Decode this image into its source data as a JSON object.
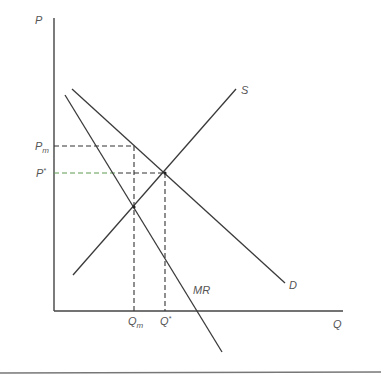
{
  "diagram": {
    "colors": {
      "axis": "#444444",
      "curve": "#3a3a3a",
      "dash": "#333333",
      "dash_green": "#5e9a52",
      "label": "#555555",
      "rule": "#777777"
    },
    "axes": {
      "y_label": "P",
      "x_label": "Q"
    },
    "curves": {
      "supply": {
        "label": "S",
        "x1": 73,
        "y1": 275,
        "x2": 236,
        "y2": 89
      },
      "demand": {
        "label": "D",
        "x1": 72,
        "y1": 89,
        "x2": 285,
        "y2": 283
      },
      "marginal_revenue": {
        "label": "MR",
        "x1": 65,
        "y1": 95,
        "x2": 222,
        "y2": 352
      }
    },
    "price_labels": {
      "monopoly": {
        "base": "P",
        "sub": "m"
      },
      "competitive": {
        "base": "P",
        "sup": "*"
      }
    },
    "quantity_labels": {
      "monopoly": {
        "base": "Q",
        "sub": "m"
      },
      "competitive": {
        "base": "Q",
        "sup": "*"
      }
    }
  }
}
